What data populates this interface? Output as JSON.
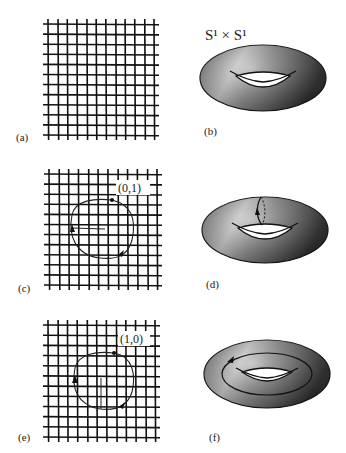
{
  "figure": {
    "title": "S¹ × S¹",
    "panels": [
      {
        "id": "a",
        "label": "(a)",
        "kind": "grid",
        "description": "square lattice (plane)"
      },
      {
        "id": "b",
        "label": "(b)",
        "kind": "torus",
        "description": "torus S¹ × S¹"
      },
      {
        "id": "c",
        "label": "(c)",
        "kind": "grid-with-loop",
        "loop_label": "(0,1)"
      },
      {
        "id": "d",
        "label": "(d)",
        "kind": "torus-with-meridian",
        "description": "loop around the tube (meridian)"
      },
      {
        "id": "e",
        "label": "(e)",
        "kind": "grid-with-loop",
        "loop_label": "(1,0)"
      },
      {
        "id": "f",
        "label": "(f)",
        "kind": "torus-with-longitude",
        "description": "loop around the hole (longitude)"
      }
    ]
  },
  "colors": {
    "line": "#111111",
    "torus_light": "#d8d8d8",
    "torus_mid": "#7a7a7a",
    "torus_dark": "#2e2e2e",
    "background": "#ffffff"
  }
}
